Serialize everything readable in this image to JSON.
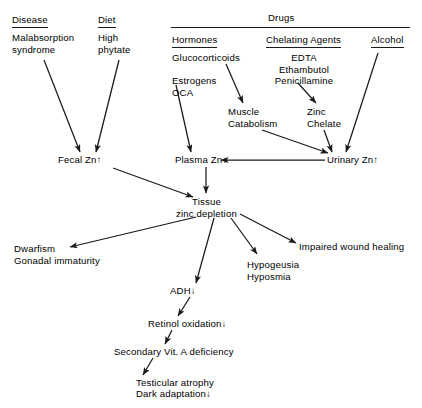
{
  "diagram": {
    "groups": {
      "disease": {
        "label": "Disease",
        "underlined": true
      },
      "diet": {
        "label": "Diet",
        "underlined": true
      },
      "drugs": {
        "label": "Drugs",
        "underlined": false
      },
      "hormones": {
        "label": "Hormones",
        "underlined": true
      },
      "chelating": {
        "label": "Chelating Agents",
        "underlined": true
      },
      "alcohol": {
        "label": "Alcohol",
        "underlined": true
      }
    },
    "causes": {
      "malabsorption": "Malabsorption\nsyndrome",
      "high_phytate": "High\nphytate",
      "hormone_list": "Glucocorticoids\n\nEstrogens\nOCA",
      "chelator_list": "EDTA\nEthambutol\nPenicillamine"
    },
    "intermediates": {
      "muscle_catabolism": "Muscle\nCatabolism",
      "zinc_chelate": "Zinc\nChelate"
    },
    "compartments": {
      "fecal_zn": {
        "label": "Fecal Zn",
        "change": "↑",
        "direction": "increase"
      },
      "plasma_zn": {
        "label": "Plasma Zn",
        "change": "↓",
        "direction": "decrease"
      },
      "urinary_zn": {
        "label": "Urinary Zn",
        "change": "↑",
        "direction": "increase"
      }
    },
    "core": {
      "tissue_depletion": "Tissue\nzinc depletion"
    },
    "outcomes": {
      "dwarfism": "Dwarfism\nGonadal immaturity",
      "hypogeusia": "Hypogeusia\nHyposmia",
      "wound_healing": "Impaired wound healing"
    },
    "cascade": {
      "adh": {
        "label": "ADH",
        "change": "↓"
      },
      "retinol": {
        "label": "Retinol oxidation",
        "change": "↓"
      },
      "vita": {
        "label": "Secondary Vit. A deficiency",
        "change": ""
      },
      "terminal_line1": "Testicular atrophy",
      "terminal_line2": {
        "label": "Dark adaptation",
        "change": "↓"
      }
    },
    "colors": {
      "ink": "#1a1a1a",
      "background": "#ffffff"
    }
  }
}
